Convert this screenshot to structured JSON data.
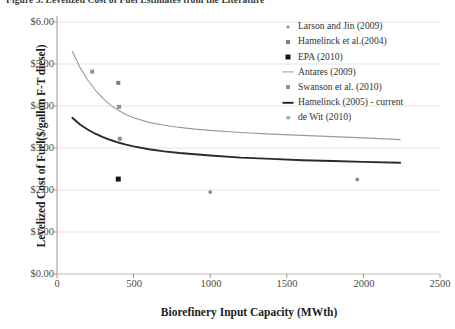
{
  "caption": {
    "text": "Figure 3.  Levelized Cost of Fuel Estimates from the Literature"
  },
  "chart_data": {
    "type": "line",
    "title": "",
    "xlabel": "Biorefinery Input Capacity (MWth)",
    "ylabel": "Levelized Cost of Fuel($/gallon F-T diesel)",
    "xlim": [
      0,
      2500
    ],
    "ylim": [
      0,
      6
    ],
    "xticks": [
      0,
      500,
      1000,
      1500,
      2000,
      2500
    ],
    "yticks": [
      "$0.00",
      "$1.00",
      "$2.00",
      "$3.00",
      "$4.00",
      "$5.00",
      "$6.00"
    ],
    "ytick_values": [
      0,
      1,
      2,
      3,
      4,
      5,
      6
    ],
    "grid": "horizontal",
    "legend_position": "top-right",
    "series": [
      {
        "name": "Larson and Jin (2009)",
        "kind": "scatter",
        "marker": "dot-small",
        "color": "#8a8a8a",
        "points": [
          [
            1000,
            1.95
          ],
          [
            1960,
            2.25
          ]
        ]
      },
      {
        "name": "Hamelinck et al.(2004)",
        "kind": "scatter",
        "marker": "square-gray",
        "color": "#7d7d7d",
        "points": [
          [
            400,
            4.55
          ]
        ]
      },
      {
        "name": "EPA (2010)",
        "kind": "scatter",
        "marker": "square-black",
        "color": "#151515",
        "points": [
          [
            400,
            2.26
          ]
        ]
      },
      {
        "name": "Antares (2009)",
        "kind": "line",
        "marker": "line-thin",
        "color": "#9a9a9a",
        "points": [
          [
            100,
            5.3
          ],
          [
            150,
            4.92
          ],
          [
            200,
            4.62
          ],
          [
            250,
            4.38
          ],
          [
            300,
            4.18
          ],
          [
            350,
            4.02
          ],
          [
            400,
            3.9
          ],
          [
            450,
            3.8
          ],
          [
            500,
            3.72
          ],
          [
            600,
            3.61
          ],
          [
            700,
            3.54
          ],
          [
            800,
            3.49
          ],
          [
            900,
            3.45
          ],
          [
            1000,
            3.42
          ],
          [
            1200,
            3.37
          ],
          [
            1400,
            3.33
          ],
          [
            1600,
            3.3
          ],
          [
            1800,
            3.27
          ],
          [
            2000,
            3.24
          ],
          [
            2240,
            3.2
          ]
        ]
      },
      {
        "name": "Swanson et al. (2010)",
        "kind": "scatter",
        "marker": "square-midgray",
        "color": "#8f8f8f",
        "points": [
          [
            230,
            4.82
          ],
          [
            405,
            3.98
          ],
          [
            410,
            3.22
          ]
        ]
      },
      {
        "name": "Hamelinck (2005) - current",
        "kind": "line",
        "marker": "line-thick",
        "color": "#2a2a2a",
        "points": [
          [
            100,
            3.72
          ],
          [
            150,
            3.56
          ],
          [
            200,
            3.44
          ],
          [
            250,
            3.34
          ],
          [
            300,
            3.26
          ],
          [
            350,
            3.19
          ],
          [
            400,
            3.13
          ],
          [
            450,
            3.08
          ],
          [
            500,
            3.04
          ],
          [
            600,
            2.97
          ],
          [
            700,
            2.92
          ],
          [
            800,
            2.88
          ],
          [
            900,
            2.85
          ],
          [
            1000,
            2.82
          ],
          [
            1200,
            2.77
          ],
          [
            1400,
            2.74
          ],
          [
            1600,
            2.71
          ],
          [
            1800,
            2.69
          ],
          [
            2000,
            2.67
          ],
          [
            2240,
            2.65
          ]
        ]
      },
      {
        "name": "de Wit (2010)",
        "kind": "scatter",
        "marker": "square-lightgray",
        "color": "#a9a9a9",
        "points": []
      }
    ]
  }
}
